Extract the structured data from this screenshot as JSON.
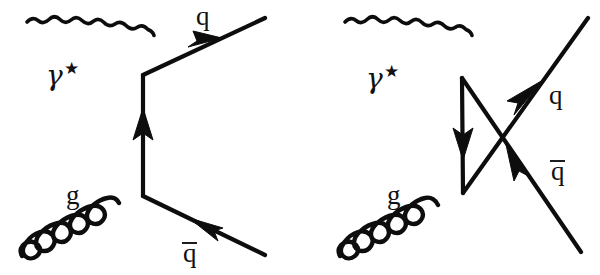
{
  "figure": {
    "width": 600,
    "height": 275,
    "background": "#ffffff",
    "ink_color": "#0d0d0d",
    "label_color": "#111111"
  },
  "diagrams": [
    {
      "id": "left",
      "name": "t-channel photon-gluon fusion",
      "labels": {
        "photon": "γ",
        "photon_star": "★",
        "gluon": "g",
        "quark": "q",
        "antiquark": "q",
        "antiquark_bar": true
      },
      "label_positions": {
        "photon": [
          46,
          85
        ],
        "photon_star": [
          67,
          76
        ],
        "gluon": [
          66,
          204
        ],
        "quark": [
          196,
          25
        ],
        "antiquark": [
          183,
          255
        ]
      },
      "vertices": {
        "top": [
          143,
          75
        ],
        "bottom": [
          143,
          196
        ]
      },
      "lines": {
        "photon_in": {
          "from": [
            27,
            22
          ],
          "to": [
            143,
            75
          ],
          "style": "wavy",
          "waves": 11
        },
        "gluon_in": {
          "from": [
            22,
            256
          ],
          "to": [
            143,
            196
          ],
          "style": "coil",
          "loops": 5
        },
        "quark_out": {
          "from": [
            143,
            75
          ],
          "to": [
            265,
            18
          ],
          "style": "straight",
          "arrow": "forward"
        },
        "antiquark_out": {
          "from": [
            265,
            255
          ],
          "to": [
            143,
            196
          ],
          "style": "straight",
          "arrow": "forward"
        },
        "propagator": {
          "from": [
            143,
            196
          ],
          "to": [
            143,
            75
          ],
          "style": "straight",
          "arrow": "up"
        }
      }
    },
    {
      "id": "right",
      "name": "u-channel crossed photon-gluon fusion",
      "labels": {
        "photon": "γ",
        "photon_star": "★",
        "gluon": "g",
        "quark": "q",
        "antiquark": "q",
        "antiquark_bar": true
      },
      "label_positions": {
        "photon": [
          372,
          88
        ],
        "photon_star": [
          393,
          79
        ],
        "gluon": [
          387,
          204
        ],
        "quark": [
          553,
          104
        ],
        "antiquark": [
          555,
          180
        ]
      },
      "vertices": {
        "top": [
          462,
          78
        ],
        "bottom": [
          463,
          193
        ]
      },
      "lines": {
        "photon_in": {
          "from": [
            345,
            22
          ],
          "to": [
            462,
            78
          ],
          "style": "wavy",
          "waves": 11
        },
        "gluon_in": {
          "from": [
            340,
            256
          ],
          "to": [
            463,
            193
          ],
          "style": "coil",
          "loops": 5
        },
        "quark_out": {
          "from": [
            463,
            193
          ],
          "to": [
            588,
            18
          ],
          "style": "straight",
          "arrow": "forward"
        },
        "antiquark_out": {
          "from": [
            462,
            78
          ],
          "to": [
            581,
            252
          ],
          "style": "straight",
          "arrow": "reverse"
        },
        "propagator": {
          "from": [
            462,
            78
          ],
          "to": [
            463,
            193
          ],
          "style": "straight",
          "arrow": "down"
        }
      }
    }
  ]
}
